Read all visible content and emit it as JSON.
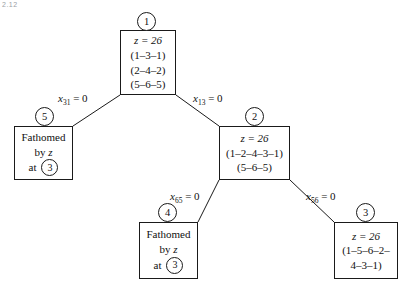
{
  "figure": {
    "corner_artifact": "2.12",
    "type": "branch-and-bound-tree"
  },
  "nodes": {
    "n1": {
      "label": "1",
      "lines": [
        "z = 26",
        "(1–3–1)",
        "(2–4–2)",
        "(5–6–5)"
      ]
    },
    "n2": {
      "label": "2",
      "lines": [
        "z = 26",
        "(1–2–4–3–1)",
        "(5–6–5)"
      ]
    },
    "n3": {
      "label": "3",
      "lines": [
        "z = 26",
        "(1–5–6–2–",
        "4–3–1)"
      ]
    },
    "n4": {
      "label": "4",
      "fathomed_line1": "Fathomed",
      "fathomed_line2_prefix": "by",
      "fathomed_line2_var": "z",
      "fathomed_line3_prefix": "at",
      "fathomed_line3_value": "3"
    },
    "n5": {
      "label": "5",
      "fathomed_line1": "Fathomed",
      "fathomed_line2_prefix": "by",
      "fathomed_line2_var": "z",
      "fathomed_line3_prefix": "at",
      "fathomed_line3_value": "3"
    }
  },
  "edges": {
    "e1_5": {
      "var": "x",
      "sub": "31",
      "rhs": "= 0"
    },
    "e1_2": {
      "var": "x",
      "sub": "13",
      "rhs": "= 0"
    },
    "e2_4": {
      "var": "x",
      "sub": "65",
      "rhs": "= 0"
    },
    "e2_3": {
      "var": "x",
      "sub": "56",
      "rhs": "= 0"
    }
  },
  "colors": {
    "stroke": "#1a1a1a",
    "background": "#ffffff",
    "text": "#111111"
  }
}
